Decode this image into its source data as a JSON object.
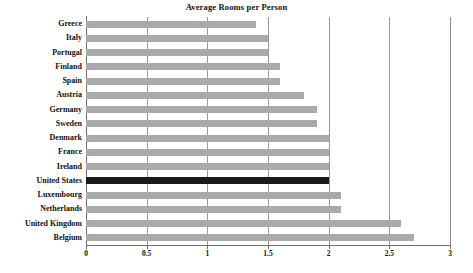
{
  "chart_data": {
    "type": "bar",
    "orientation": "horizontal",
    "title": "Average Rooms per Person",
    "xlabel": "",
    "ylabel": "",
    "xlim": [
      0,
      3
    ],
    "xticks": [
      "0",
      "0.5",
      "1",
      "1.5",
      "2",
      "2.5",
      "3"
    ],
    "xtick_values": [
      0,
      0.5,
      1,
      1.5,
      2,
      2.5,
      3
    ],
    "grid": true,
    "legend": "none",
    "categories": [
      "Greece",
      "Italy",
      "Portugal",
      "Finland",
      "Spain",
      "Austria",
      "Germany",
      "Sweden",
      "Denmark",
      "France",
      "Ireland",
      "United States",
      "Luxembourg",
      "Netherlands",
      "United Kingdom",
      "Belgium"
    ],
    "values": [
      1.4,
      1.5,
      1.5,
      1.6,
      1.6,
      1.8,
      1.9,
      1.9,
      2.0,
      2.0,
      2.0,
      2.0,
      2.1,
      2.1,
      2.6,
      2.7
    ],
    "bar_color": "#aaaaaa",
    "highlight_color": "#1a1a1a",
    "highlighted_category": "United States"
  }
}
